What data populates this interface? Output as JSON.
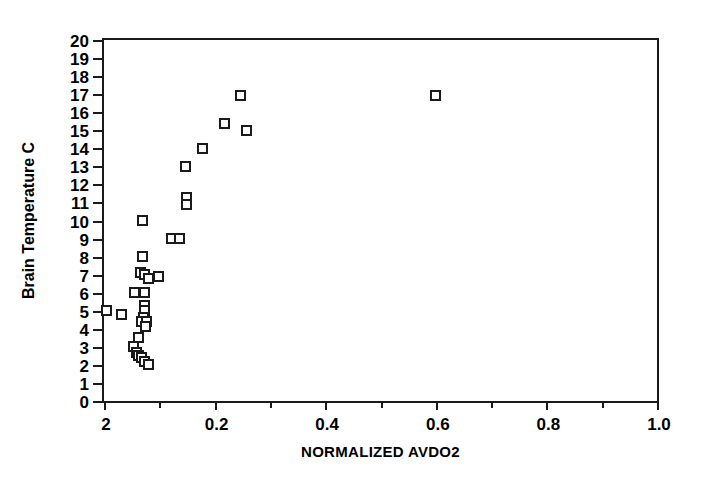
{
  "chart_data": {
    "type": "scatter",
    "title": "",
    "subtitle": "",
    "xlabel": "NORMALIZED AVDO2",
    "ylabel": "Brain Temperature C",
    "xlim": [
      0.0,
      1.0
    ],
    "ylim": [
      0,
      20
    ],
    "grid": false,
    "legend": null,
    "x_major_ticks": [
      0.0,
      0.2,
      0.4,
      0.6,
      0.8,
      1.0
    ],
    "x_major_tick_labels": [
      "2",
      "0.2",
      "0.4",
      "0.6",
      "0.8",
      "1.0"
    ],
    "x_minor_ticks": [
      0.1,
      0.3,
      0.5,
      0.7,
      0.9
    ],
    "y_ticks": [
      0,
      1,
      2,
      3,
      4,
      5,
      6,
      7,
      8,
      9,
      10,
      11,
      12,
      13,
      14,
      15,
      16,
      17,
      18,
      19,
      20
    ],
    "y_tick_labels": [
      "0",
      "1",
      "2",
      "3",
      "4",
      "5",
      "6",
      "7",
      "8",
      "9",
      "10",
      "11",
      "12",
      "13",
      "14",
      "15",
      "16",
      "17",
      "18",
      "19",
      "20"
    ],
    "marker": "open-square",
    "marker_color": "#1a1a1a",
    "series": [
      {
        "name": "Brain Temperature vs Normalized AVDO2",
        "points": [
          {
            "x": 0.005,
            "y": 5.0
          },
          {
            "x": 0.032,
            "y": 4.8
          },
          {
            "x": 0.053,
            "y": 3.0
          },
          {
            "x": 0.058,
            "y": 2.7
          },
          {
            "x": 0.063,
            "y": 2.5
          },
          {
            "x": 0.068,
            "y": 2.4
          },
          {
            "x": 0.074,
            "y": 2.2
          },
          {
            "x": 0.081,
            "y": 2.0
          },
          {
            "x": 0.062,
            "y": 3.5
          },
          {
            "x": 0.055,
            "y": 6.0
          },
          {
            "x": 0.074,
            "y": 6.0
          },
          {
            "x": 0.073,
            "y": 5.3
          },
          {
            "x": 0.073,
            "y": 5.0
          },
          {
            "x": 0.071,
            "y": 4.6
          },
          {
            "x": 0.068,
            "y": 4.4
          },
          {
            "x": 0.076,
            "y": 4.4
          },
          {
            "x": 0.075,
            "y": 4.1
          },
          {
            "x": 0.069,
            "y": 8.0
          },
          {
            "x": 0.066,
            "y": 7.1
          },
          {
            "x": 0.074,
            "y": 7.0
          },
          {
            "x": 0.08,
            "y": 6.8
          },
          {
            "x": 0.07,
            "y": 10.0
          },
          {
            "x": 0.098,
            "y": 6.9
          },
          {
            "x": 0.122,
            "y": 9.0
          },
          {
            "x": 0.137,
            "y": 9.0
          },
          {
            "x": 0.15,
            "y": 11.3
          },
          {
            "x": 0.15,
            "y": 10.9
          },
          {
            "x": 0.148,
            "y": 13.0
          },
          {
            "x": 0.178,
            "y": 14.0
          },
          {
            "x": 0.218,
            "y": 15.4
          },
          {
            "x": 0.246,
            "y": 16.9
          },
          {
            "x": 0.258,
            "y": 15.0
          },
          {
            "x": 0.6,
            "y": 16.9
          }
        ]
      }
    ]
  },
  "axes": {
    "y_title": "Brain Temperature C",
    "x_title": "NORMALIZED AVDO2"
  }
}
